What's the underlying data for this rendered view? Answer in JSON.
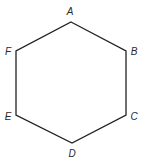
{
  "diagram": {
    "type": "hexagon",
    "stroke_color": "#222222",
    "label_color": "#2a2a2a",
    "background": "#ffffff",
    "vertices": [
      {
        "name": "A",
        "x": 71,
        "y": 22,
        "label_x": 70,
        "label_y": 15
      },
      {
        "name": "B",
        "x": 126,
        "y": 51,
        "label_x": 134,
        "label_y": 55
      },
      {
        "name": "C",
        "x": 126,
        "y": 115,
        "label_x": 134,
        "label_y": 120
      },
      {
        "name": "D",
        "x": 72,
        "y": 143,
        "label_x": 72,
        "label_y": 157
      },
      {
        "name": "E",
        "x": 16,
        "y": 115,
        "label_x": 8,
        "label_y": 120
      },
      {
        "name": "F",
        "x": 16,
        "y": 51,
        "label_x": 8,
        "label_y": 55
      }
    ],
    "edges": [
      [
        "A",
        "B"
      ],
      [
        "B",
        "C"
      ],
      [
        "C",
        "D"
      ],
      [
        "D",
        "E"
      ],
      [
        "E",
        "F"
      ],
      [
        "F",
        "A"
      ]
    ]
  }
}
